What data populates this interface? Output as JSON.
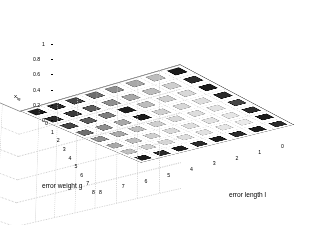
{
  "figure": {
    "background_color": "#ffffff",
    "type": "matlab-bar3-3d-plot"
  },
  "axes": {
    "z": {
      "label": "x",
      "label_subscript": "lg",
      "ticks": [
        "1",
        "0.8",
        "0.6",
        "0.4",
        "0.2",
        "0"
      ],
      "tick_values": [
        1,
        0.8,
        0.6,
        0.4,
        0.2,
        0
      ],
      "range": [
        0,
        1
      ]
    },
    "x": {
      "label": "error length l",
      "ticks": [
        "8",
        "7",
        "6",
        "5",
        "4",
        "3",
        "2",
        "1",
        "0"
      ],
      "tick_values": [
        8,
        7,
        6,
        5,
        4,
        3,
        2,
        1,
        0
      ],
      "range": [
        0,
        8
      ]
    },
    "y": {
      "label": "error weight g",
      "ticks": [
        "0",
        "1",
        "2",
        "3",
        "4",
        "5",
        "6",
        "7",
        "8"
      ],
      "tick_values": [
        0,
        1,
        2,
        3,
        4,
        5,
        6,
        7,
        8
      ],
      "range": [
        0,
        8
      ]
    }
  },
  "chart_data": {
    "type": "bar",
    "title": "",
    "xlabel": "error length l",
    "ylabel": "error weight g",
    "zlabel": "x_lg",
    "xlim": [
      0,
      8
    ],
    "ylim": [
      0,
      8
    ],
    "zlim": [
      0,
      1
    ],
    "grid": true,
    "legend": null,
    "x": [
      1,
      2,
      3,
      4,
      5,
      6,
      7,
      8
    ],
    "y": [
      1,
      2,
      3,
      4,
      5,
      6,
      7,
      8
    ],
    "note": "8x8 grid of bars; all values are ~0 (flat tiles) except one bar at (l=4,g=3) which reaches 1.0. Tile face shades encode the bar index colormap.",
    "peak": {
      "error_length_l": 4,
      "error_weight_g": 3,
      "value": 1.0
    },
    "values": [
      [
        0,
        0,
        0,
        0,
        0,
        0,
        0,
        0
      ],
      [
        0,
        0,
        0,
        0,
        0,
        0,
        0,
        0
      ],
      [
        0,
        0,
        0,
        1.0,
        0,
        0,
        0,
        0
      ],
      [
        0,
        0,
        0,
        0,
        0,
        0,
        0,
        0
      ],
      [
        0,
        0,
        0,
        0,
        0,
        0,
        0,
        0
      ],
      [
        0,
        0,
        0,
        0,
        0,
        0,
        0,
        0
      ],
      [
        0,
        0,
        0,
        0,
        0,
        0,
        0,
        0
      ],
      [
        0,
        0,
        0,
        0,
        0,
        0,
        0,
        0
      ]
    ],
    "tile_shades": [
      [
        "#1c1c1c",
        "#2b2b2b",
        "#454545",
        "#6e6e6e",
        "#8f8f8f",
        "#a8a8a8",
        "#bdbdbd",
        "#1c1c1c"
      ],
      [
        "#2b2b2b",
        "#3a3a3a",
        "#5c5c5c",
        "#8f8f8f",
        "#a8a8a8",
        "#bdbdbd",
        "#cfcfcf",
        "#2b2b2b"
      ],
      [
        "#454545",
        "#5c5c5c",
        "#7d7d7d",
        "#a8a8a8",
        "#bdbdbd",
        "#cfcfcf",
        "#d8d8d8",
        "#1c1c1c"
      ],
      [
        "#6e6e6e",
        "#8f8f8f",
        "#a8a8a8",
        "#1c1c1c",
        "#cfcfcf",
        "#d8d8d8",
        "#dedede",
        "#2b2b2b"
      ],
      [
        "#8f8f8f",
        "#a8a8a8",
        "#bdbdbd",
        "#cfcfcf",
        "#d8d8d8",
        "#dedede",
        "#e2e2e2",
        "#454545"
      ],
      [
        "#a8a8a8",
        "#bdbdbd",
        "#cfcfcf",
        "#d8d8d8",
        "#dedede",
        "#e2e2e2",
        "#e6e6e6",
        "#2b2b2b"
      ],
      [
        "#bdbdbd",
        "#cfcfcf",
        "#d8d8d8",
        "#dedede",
        "#e2e2e2",
        "#e6e6e6",
        "#ebebeb",
        "#1c1c1c"
      ],
      [
        "#1c1c1c",
        "#2b2b2b",
        "#1c1c1c",
        "#2b2b2b",
        "#1c1c1c",
        "#2b2b2b",
        "#1c1c1c",
        "#2b2b2b"
      ]
    ],
    "peak_bar_color": "#1f1f1f"
  }
}
